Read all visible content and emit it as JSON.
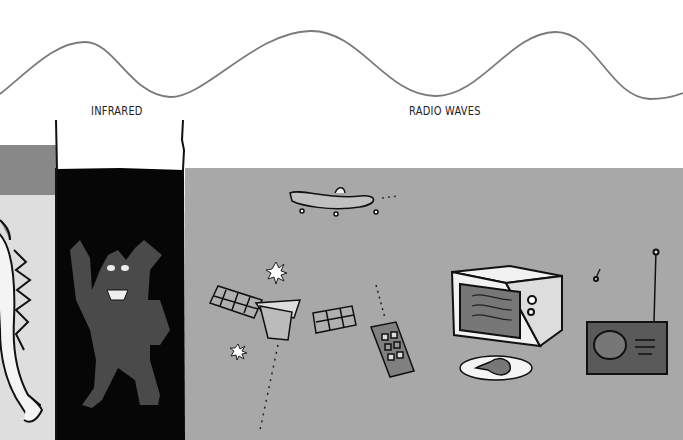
{
  "wave": {
    "color": "#777777"
  },
  "bands": [
    {
      "id": "visible-edge",
      "label": "",
      "color": "#8a8a8a"
    },
    {
      "id": "infrared",
      "label": "INFRARED",
      "color": "#050505"
    },
    {
      "id": "radio-waves",
      "label": "RADIO WAVES",
      "color": "#a6a6a6"
    }
  ],
  "illustrations": {
    "infrared": [
      "werewolf"
    ],
    "radio_waves": [
      "airplane",
      "satellite",
      "stars",
      "smartphone",
      "microwave-oven",
      "chicken-plate",
      "radio",
      "music-note"
    ]
  }
}
